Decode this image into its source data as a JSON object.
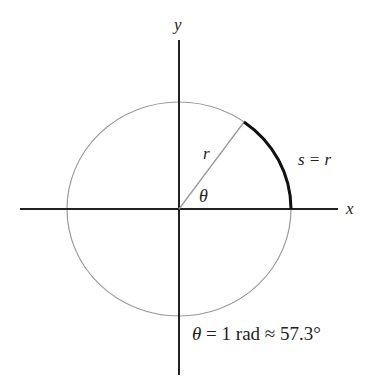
{
  "diagram": {
    "axes": {
      "x_label": "x",
      "y_label": "y"
    },
    "circle": {
      "center": [
        179,
        209
      ],
      "radius": 112
    },
    "radius_line": {
      "label": "r"
    },
    "angle": {
      "label": "θ",
      "value_rad": 1
    },
    "arc": {
      "label": "s = r"
    },
    "equation": {
      "theta": "θ",
      "rest": " = 1 rad ≈ 57.3°"
    },
    "colors": {
      "axis": "#222222",
      "circle": "#9a9a9a",
      "arc": "#111111",
      "radius_line": "#9a9a9a"
    }
  }
}
